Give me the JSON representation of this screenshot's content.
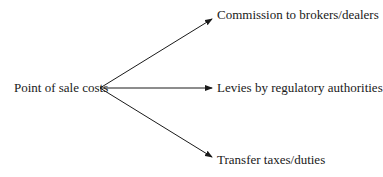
{
  "diagram": {
    "source": {
      "label": "Point of sale costs"
    },
    "targets": [
      {
        "label": "Commission to brokers/dealers"
      },
      {
        "label": "Levies by regulatory authorities"
      },
      {
        "label": "Transfer taxes/duties"
      }
    ],
    "colors": {
      "line": "#1a1a1a",
      "text": "#1a1a1a",
      "background": "#ffffff"
    }
  }
}
